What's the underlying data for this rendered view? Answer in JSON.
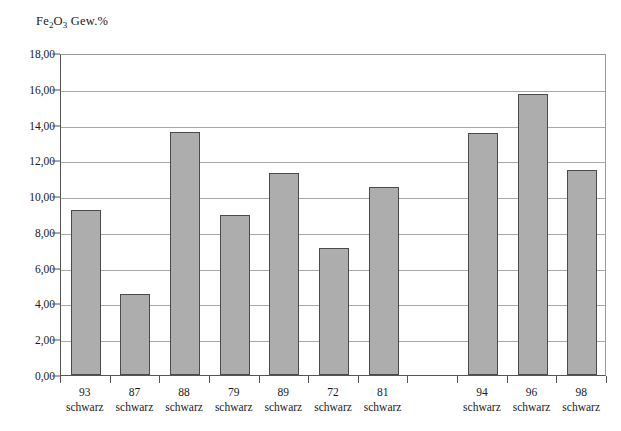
{
  "chart_data": {
    "type": "bar",
    "title": "Fe2O3 Gew.%",
    "title_parts": {
      "pre": "Fe",
      "sub1": "2",
      "mid": "O",
      "sub2": "3",
      "post": " Gew.%"
    },
    "xlabel": "",
    "ylabel": "Fe2O3 Gew.%",
    "ylim": [
      0,
      18
    ],
    "ytick_step": 2,
    "ytick_labels": [
      "0,00",
      "2,00",
      "4,00",
      "6,00",
      "8,00",
      "10,00",
      "12,00",
      "14,00",
      "16,00",
      "18,00"
    ],
    "ytick_values": [
      0,
      2,
      4,
      6,
      8,
      10,
      12,
      14,
      16,
      18
    ],
    "grid": true,
    "legend": "none",
    "decimal_separator": ",",
    "bar_fill": "#adadad",
    "bar_border": "#4a4a4a",
    "categories": [
      "93 schwarz",
      "87 schwarz",
      "88 schwarz",
      "79 schwarz",
      "89 schwarz",
      "72 schwarz",
      "81 schwarz",
      "",
      "94 schwarz",
      "96 schwarz",
      "98 schwarz"
    ],
    "category_lines": [
      {
        "num": "93",
        "name": "schwarz"
      },
      {
        "num": "87",
        "name": "schwarz"
      },
      {
        "num": "88",
        "name": "schwarz"
      },
      {
        "num": "79",
        "name": "schwarz"
      },
      {
        "num": "89",
        "name": "schwarz"
      },
      {
        "num": "72",
        "name": "schwarz"
      },
      {
        "num": "81",
        "name": "schwarz"
      },
      {
        "num": "",
        "name": ""
      },
      {
        "num": "94",
        "name": "schwarz"
      },
      {
        "num": "96",
        "name": "schwarz"
      },
      {
        "num": "98",
        "name": "schwarz"
      }
    ],
    "values": [
      9.2,
      4.55,
      13.6,
      8.95,
      11.3,
      7.1,
      10.5,
      null,
      13.55,
      15.7,
      11.45
    ]
  }
}
